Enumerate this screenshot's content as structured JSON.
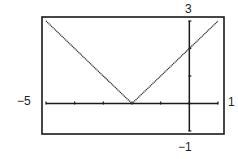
{
  "chart_data": {
    "type": "line",
    "title": "",
    "function": "y = |x + 2|",
    "xlabel": "",
    "ylabel": "",
    "xlim": [
      -5,
      1
    ],
    "ylim": [
      -1,
      3
    ],
    "xscale": 1,
    "yscale": 1,
    "grid": false,
    "legend": null,
    "window_labels": {
      "xmin": "−5",
      "xmax": "1",
      "ymin": "−1",
      "ymax": "3"
    },
    "series": [
      {
        "name": "y = |x + 2|",
        "x": [
          -5,
          -4,
          -3,
          -2,
          -1,
          0,
          1
        ],
        "values": [
          3,
          2,
          1,
          0,
          1,
          2,
          3
        ]
      }
    ]
  },
  "colors": {
    "axis": "#1a1a1a",
    "curve": "#333333",
    "frame": "#1a1a1a"
  }
}
